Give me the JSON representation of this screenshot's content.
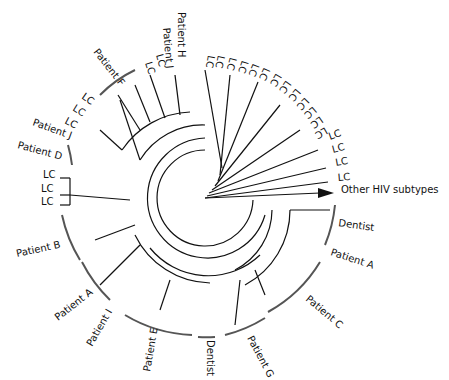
{
  "diagram": {
    "type": "circular-phylogenetic-tree",
    "center": [
      205,
      198
    ],
    "outgroup_label": "Other HIV subtypes",
    "labels": [
      {
        "text": "Patient H",
        "x": 178,
        "y": 12,
        "rot": 90
      },
      {
        "text": "Patient J",
        "x": 163,
        "y": 28,
        "rot": 85
      },
      {
        "text": "LC",
        "x": 156,
        "y": 55,
        "rot": 75
      },
      {
        "text": "LC",
        "x": 145,
        "y": 63,
        "rot": 72
      },
      {
        "text": "Patient F",
        "x": 93,
        "y": 52,
        "rot": 52
      },
      {
        "text": "LC",
        "x": 81,
        "y": 98,
        "rot": 35
      },
      {
        "text": "LC",
        "x": 72,
        "y": 110,
        "rot": 32
      },
      {
        "text": "LC",
        "x": 64,
        "y": 123,
        "rot": 28
      },
      {
        "text": "Patient J",
        "x": 32,
        "y": 125,
        "rot": 20
      },
      {
        "text": "Patient D",
        "x": 17,
        "y": 148,
        "rot": 15
      },
      {
        "text": "LC",
        "x": 43,
        "y": 178,
        "rot": 0
      },
      {
        "text": "LC",
        "x": 41,
        "y": 192,
        "rot": 0
      },
      {
        "text": "LC",
        "x": 41,
        "y": 205,
        "rot": 0
      },
      {
        "text": "Patient B",
        "x": 17,
        "y": 257,
        "rot": -12
      },
      {
        "text": "Patient A",
        "x": 58,
        "y": 321,
        "rot": -38
      },
      {
        "text": "Patient I",
        "x": 92,
        "y": 347,
        "rot": -60
      },
      {
        "text": "Patient E",
        "x": 150,
        "y": 372,
        "rot": -80
      },
      {
        "text": "Dentist",
        "x": 207,
        "y": 340,
        "rot": 90
      },
      {
        "text": "Patient G",
        "x": 247,
        "y": 338,
        "rot": 62
      },
      {
        "text": "Patient C",
        "x": 305,
        "y": 300,
        "rot": 40
      },
      {
        "text": "Patient A",
        "x": 330,
        "y": 255,
        "rot": 18
      },
      {
        "text": "Dentist",
        "x": 338,
        "y": 226,
        "rot": 8
      },
      {
        "text": "LC",
        "x": 208,
        "y": 55,
        "rot": 100
      },
      {
        "text": "LC",
        "x": 218,
        "y": 55,
        "rot": 102
      },
      {
        "text": "LC",
        "x": 230,
        "y": 57,
        "rot": 105
      },
      {
        "text": "LC",
        "x": 242,
        "y": 60,
        "rot": 108
      },
      {
        "text": "LC",
        "x": 253,
        "y": 63,
        "rot": 112
      },
      {
        "text": "LC",
        "x": 264,
        "y": 67,
        "rot": 115
      },
      {
        "text": "LC",
        "x": 276,
        "y": 73,
        "rot": 120
      },
      {
        "text": "LC",
        "x": 286,
        "y": 80,
        "rot": 125
      },
      {
        "text": "LC",
        "x": 296,
        "y": 88,
        "rot": 130
      },
      {
        "text": "LC",
        "x": 305,
        "y": 97,
        "rot": 135
      },
      {
        "text": "LC",
        "x": 313,
        "y": 106,
        "rot": 140
      },
      {
        "text": "LC",
        "x": 320,
        "y": 116,
        "rot": 145
      },
      {
        "text": "LC",
        "x": 325,
        "y": 127,
        "rot": 150
      },
      {
        "text": "LC",
        "x": 330,
        "y": 140,
        "rot": -20
      },
      {
        "text": "LC",
        "x": 333,
        "y": 153,
        "rot": -15
      },
      {
        "text": "LC",
        "x": 336,
        "y": 166,
        "rot": -10
      },
      {
        "text": "LC",
        "x": 338,
        "y": 181,
        "rot": -5
      }
    ]
  }
}
